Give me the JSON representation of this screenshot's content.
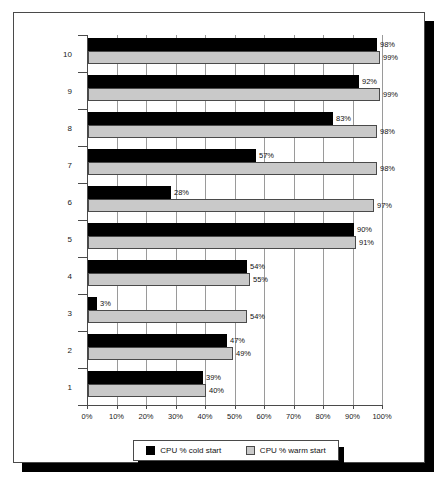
{
  "chart_data": {
    "type": "bar",
    "orientation": "horizontal",
    "title": "",
    "subtitle": "",
    "xlabel": "",
    "ylabel": "",
    "xlim": [
      0,
      100
    ],
    "xticks": [
      "0%",
      "10%",
      "20%",
      "30%",
      "40%",
      "50%",
      "60%",
      "70%",
      "80%",
      "90%",
      "100%"
    ],
    "xtick_values": [
      0,
      10,
      20,
      30,
      40,
      50,
      60,
      70,
      80,
      90,
      100
    ],
    "grid": true,
    "grid_axis": "x",
    "legend_position": "bottom",
    "categories": [
      "1",
      "2",
      "3",
      "4",
      "5",
      "6",
      "7",
      "8",
      "9",
      "10"
    ],
    "series": [
      {
        "name": "CPU % cold start",
        "color": "#000000",
        "values": [
          39,
          47,
          3,
          54,
          90,
          28,
          57,
          83,
          92,
          98
        ],
        "labels": [
          "39%",
          "47%",
          "3%",
          "54%",
          "90%",
          "28%",
          "57%",
          "83%",
          "92%",
          "98%"
        ]
      },
      {
        "name": "CPU % warm start",
        "color": "#c9c9c9",
        "values": [
          40,
          49,
          54,
          55,
          91,
          97,
          98,
          98,
          99,
          99
        ],
        "labels": [
          "40%",
          "49%",
          "54%",
          "55%",
          "91%",
          "97%",
          "98%",
          "98%",
          "99%",
          "99%"
        ]
      }
    ]
  },
  "legend": {
    "items": [
      {
        "label": "CPU % cold start",
        "swatch": "cold"
      },
      {
        "label": "CPU % warm start",
        "swatch": "warm"
      }
    ]
  }
}
